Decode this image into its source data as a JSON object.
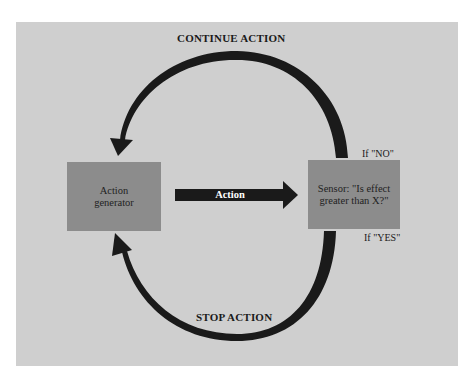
{
  "diagram": {
    "type": "feedback-loop",
    "colors": {
      "background": "#cfcfcf",
      "box_fill": "#8c8c8c",
      "arrow": "#1a1a1a",
      "arrow_text": "#ffffff"
    },
    "top_arc_label": "CONTINUE ACTION",
    "bottom_arc_label": "STOP ACTION",
    "nodes": {
      "generator": {
        "line1": "Action",
        "line2": "generator"
      },
      "sensor": {
        "line1": "Sensor: \"Is effect",
        "line2": "greater than X?\""
      }
    },
    "action_arrow_label": "Action",
    "branch_no": "If \"NO\"",
    "branch_yes": "If \"YES\""
  }
}
